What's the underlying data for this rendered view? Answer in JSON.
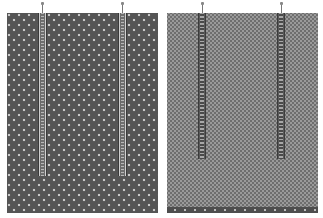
{
  "figure": {
    "panels": [
      {
        "id": "left",
        "description": "Dark lattice with sparse light holes and two vertical waveguide rods",
        "background_color": "#555555",
        "dot_color": "#c8c8c8",
        "rods": [
          {
            "x": 39,
            "bottom": 176
          },
          {
            "x": 119,
            "bottom": 176
          }
        ]
      },
      {
        "id": "right",
        "description": "Light gray dense lattice with two darker vertical waveguide rods and dark bottom strip",
        "background_color": "#9a9a9a",
        "dot_color": "#6e6e6e",
        "rods": [
          {
            "x": 199,
            "bottom": 159
          },
          {
            "x": 278,
            "bottom": 159
          }
        ]
      }
    ],
    "markers": [
      {
        "x": 42
      },
      {
        "x": 122
      },
      {
        "x": 202
      },
      {
        "x": 282
      }
    ]
  }
}
